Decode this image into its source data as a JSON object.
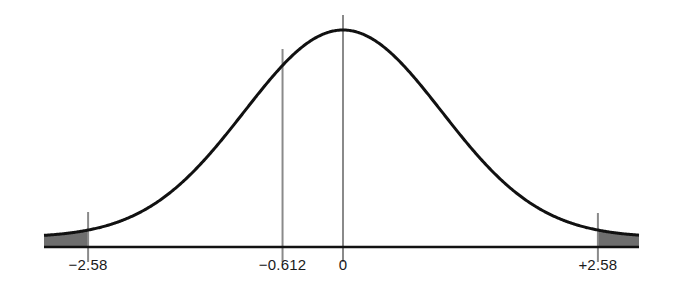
{
  "diagram": {
    "type": "normal-distribution-curve",
    "colors": {
      "curve": "#111111",
      "baseline": "#111111",
      "markers": "#8a8a8a",
      "shaded_tail": "#6e6e6e"
    },
    "markers": [
      {
        "id": "neg-2-58",
        "value": -2.58,
        "label": "−2.58"
      },
      {
        "id": "neg-0-612",
        "value": -0.612,
        "label": "−0.612"
      },
      {
        "id": "zero",
        "value": 0,
        "label": "0"
      },
      {
        "id": "pos-2-58",
        "value": 2.58,
        "label": "+2.58"
      }
    ],
    "shaded_regions": [
      {
        "id": "left-tail",
        "from": "-inf",
        "to": -2.58
      },
      {
        "id": "right-tail",
        "from": 2.58,
        "to": "+inf"
      }
    ]
  },
  "chart_data": {
    "type": "line",
    "title": "",
    "xlabel": "",
    "ylabel": "",
    "distribution": "standard normal",
    "tick_labels": [
      "−2.58",
      "−0.612",
      "0",
      "+2.58"
    ],
    "tick_values": [
      -2.58,
      -0.612,
      0,
      2.58
    ],
    "shaded": [
      "z < -2.58",
      "z > +2.58"
    ],
    "grid": false,
    "legend": null
  }
}
